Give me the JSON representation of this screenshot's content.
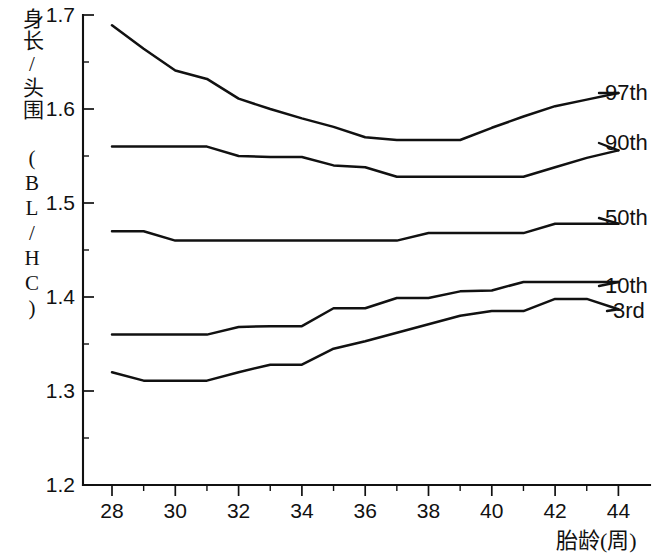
{
  "chart_data": {
    "type": "line",
    "title": "",
    "xlabel": "胎龄(周)",
    "ylabel": "身长/头围 (BL/HC)",
    "xlim": [
      27,
      45
    ],
    "ylim": [
      1.2,
      1.7
    ],
    "xticks": [
      28,
      29,
      30,
      31,
      32,
      33,
      34,
      35,
      36,
      37,
      38,
      39,
      40,
      41,
      42,
      43,
      44
    ],
    "xtick_labels": [
      "28",
      "",
      "30",
      "",
      "32",
      "",
      "34",
      "",
      "36",
      "",
      "38",
      "",
      "40",
      "",
      "42",
      "",
      "44"
    ],
    "yticks": [
      1.2,
      1.25,
      1.3,
      1.35,
      1.4,
      1.45,
      1.5,
      1.55,
      1.6,
      1.65,
      1.7
    ],
    "ytick_labels": [
      "1.2",
      "",
      "1.3",
      "",
      "1.4",
      "",
      "1.5",
      "",
      "1.6",
      "",
      "1.7"
    ],
    "grid": false,
    "legend_position": "right-inline-labels",
    "x": [
      28,
      29,
      30,
      31,
      32,
      33,
      34,
      35,
      36,
      37,
      38,
      39,
      40,
      41,
      42,
      43,
      44
    ],
    "series": [
      {
        "name": "97th",
        "label": "97th",
        "values": [
          1.689,
          1.664,
          1.641,
          1.632,
          1.611,
          1.6,
          1.59,
          1.581,
          1.57,
          1.567,
          1.567,
          1.567,
          1.58,
          1.592,
          1.603,
          1.61,
          1.617
        ]
      },
      {
        "name": "90th",
        "label": "90th",
        "values": [
          1.56,
          1.56,
          1.56,
          1.56,
          1.55,
          1.549,
          1.549,
          1.54,
          1.538,
          1.528,
          1.528,
          1.528,
          1.528,
          1.528,
          1.538,
          1.548,
          1.556
        ]
      },
      {
        "name": "50th",
        "label": "50th",
        "values": [
          1.47,
          1.47,
          1.46,
          1.46,
          1.46,
          1.46,
          1.46,
          1.46,
          1.46,
          1.46,
          1.468,
          1.468,
          1.468,
          1.468,
          1.478,
          1.478,
          1.478
        ]
      },
      {
        "name": "10th",
        "label": "10th",
        "values": [
          1.36,
          1.36,
          1.36,
          1.36,
          1.368,
          1.369,
          1.369,
          1.388,
          1.388,
          1.399,
          1.399,
          1.406,
          1.407,
          1.416,
          1.416,
          1.416,
          1.416
        ]
      },
      {
        "name": "3rd",
        "label": "3rd",
        "values": [
          1.32,
          1.311,
          1.311,
          1.311,
          1.32,
          1.328,
          1.328,
          1.345,
          1.353,
          1.362,
          1.371,
          1.38,
          1.385,
          1.385,
          1.398,
          1.398,
          1.387
        ]
      }
    ],
    "colors": {
      "line": "#111111",
      "axis": "#111111",
      "background": "#ffffff"
    }
  }
}
